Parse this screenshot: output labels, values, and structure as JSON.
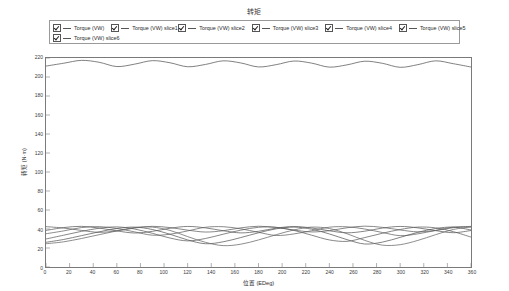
{
  "chart_data": {
    "type": "line",
    "title": "转矩",
    "xlabel": "位置 (EDeg)",
    "ylabel": "转矩 (N·m)",
    "xlim": [
      0,
      360
    ],
    "ylim": [
      0,
      220
    ],
    "xticks": [
      0,
      20,
      40,
      60,
      80,
      100,
      120,
      140,
      160,
      180,
      200,
      220,
      240,
      260,
      280,
      300,
      320,
      340,
      360
    ],
    "yticks": [
      0,
      20,
      40,
      60,
      80,
      100,
      120,
      140,
      160,
      180,
      200,
      220
    ],
    "grid": false,
    "legend_position": "top",
    "series": [
      {
        "name": "Torque (VW)",
        "color": "#555555",
        "checked": true,
        "x": [
          0,
          15,
          30,
          45,
          60,
          75,
          90,
          105,
          120,
          135,
          150,
          165,
          180,
          195,
          210,
          225,
          240,
          255,
          270,
          285,
          300,
          315,
          330,
          345,
          360
        ],
        "values": [
          211.5,
          214.5,
          217.5,
          215.5,
          211.0,
          213.5,
          217.2,
          215.0,
          210.8,
          213.2,
          217.0,
          214.8,
          210.6,
          213.0,
          216.8,
          214.6,
          210.4,
          212.8,
          216.6,
          214.4,
          210.2,
          213.0,
          217.0,
          214.0,
          210.5
        ]
      },
      {
        "name": "Torque (VW) slice1",
        "color": "#606060",
        "checked": true,
        "x": [
          0,
          15,
          30,
          45,
          60,
          75,
          90,
          105,
          120,
          135,
          150,
          165,
          180,
          195,
          210,
          225,
          240,
          255,
          270,
          285,
          300,
          315,
          330,
          345,
          360
        ],
        "values": [
          42.5,
          41.0,
          38.5,
          36.5,
          38.0,
          41.0,
          42.8,
          41.5,
          38.8,
          36.8,
          38.2,
          41.2,
          42.9,
          41.6,
          38.9,
          36.9,
          38.3,
          41.3,
          43.0,
          41.7,
          39.0,
          37.0,
          38.4,
          41.4,
          42.8
        ]
      },
      {
        "name": "Torque (VW) slice2",
        "color": "#5a5a5a",
        "checked": true,
        "x": [
          0,
          15,
          30,
          45,
          60,
          75,
          90,
          105,
          120,
          135,
          150,
          165,
          180,
          195,
          210,
          225,
          240,
          255,
          270,
          285,
          300,
          315,
          330,
          345,
          360
        ],
        "values": [
          38.5,
          41.5,
          42.8,
          41.0,
          38.0,
          35.8,
          37.5,
          40.8,
          42.7,
          41.2,
          38.2,
          35.9,
          37.6,
          40.9,
          42.6,
          41.1,
          38.1,
          36.0,
          37.7,
          41.0,
          42.7,
          41.2,
          38.3,
          36.1,
          38.4
        ]
      },
      {
        "name": "Torque (VW) slice3",
        "color": "#636363",
        "checked": true,
        "x": [
          0,
          15,
          30,
          45,
          60,
          75,
          90,
          105,
          120,
          135,
          150,
          165,
          180,
          195,
          210,
          225,
          240,
          255,
          270,
          285,
          300,
          315,
          330,
          345,
          360
        ],
        "values": [
          35.0,
          38.0,
          41.5,
          42.5,
          40.5,
          37.0,
          33.5,
          34.5,
          38.0,
          41.8,
          42.4,
          40.2,
          36.5,
          33.2,
          34.8,
          38.2,
          41.9,
          42.3,
          40.0,
          36.3,
          33.0,
          34.9,
          38.5,
          42.0,
          42.2
        ]
      },
      {
        "name": "Torque (VW) slice4",
        "color": "#5d5d5d",
        "checked": true,
        "x": [
          0,
          15,
          30,
          45,
          60,
          75,
          90,
          105,
          120,
          135,
          150,
          165,
          180,
          195,
          210,
          225,
          240,
          255,
          270,
          285,
          300,
          315,
          330,
          345,
          360
        ],
        "values": [
          29.5,
          33.5,
          37.5,
          40.8,
          42.2,
          40.0,
          35.5,
          30.5,
          27.5,
          30.0,
          34.5,
          38.8,
          41.8,
          41.8,
          38.5,
          33.5,
          28.5,
          27.0,
          31.0,
          35.5,
          39.5,
          42.0,
          41.2,
          37.2,
          31.5
        ]
      },
      {
        "name": "Torque (VW) slice5",
        "color": "#585858",
        "checked": true,
        "x": [
          0,
          15,
          30,
          45,
          60,
          75,
          90,
          105,
          120,
          135,
          150,
          165,
          180,
          195,
          210,
          225,
          240,
          255,
          270,
          285,
          300,
          315,
          330,
          345,
          360
        ],
        "values": [
          26.0,
          29.0,
          33.0,
          37.0,
          40.5,
          42.0,
          39.5,
          34.5,
          28.5,
          24.5,
          26.5,
          31.0,
          36.0,
          40.2,
          42.0,
          39.8,
          34.8,
          28.8,
          24.2,
          26.2,
          31.2,
          36.5,
          40.5,
          42.0,
          39.0
        ]
      },
      {
        "name": "Torque (VW) slice6",
        "color": "#656565",
        "checked": true,
        "x": [
          0,
          15,
          30,
          45,
          60,
          75,
          90,
          105,
          120,
          135,
          150,
          165,
          180,
          195,
          210,
          225,
          240,
          255,
          270,
          285,
          300,
          315,
          330,
          345,
          360
        ],
        "values": [
          24.5,
          26.5,
          30.0,
          34.0,
          38.0,
          41.5,
          42.0,
          38.5,
          32.0,
          26.0,
          22.5,
          24.0,
          28.5,
          34.0,
          39.0,
          42.0,
          40.5,
          35.0,
          28.0,
          23.0,
          23.5,
          28.0,
          34.0,
          39.5,
          42.2
        ]
      }
    ]
  },
  "legend": {
    "row1": [
      {
        "label": "Torque (VW)"
      },
      {
        "label": "Torque (VW) slice1"
      },
      {
        "label": "Torque (VW) slice2"
      },
      {
        "label": "Torque (VW) slice3"
      },
      {
        "label": "Torque (VW) slice4"
      },
      {
        "label": "Torque (VW) slice5"
      }
    ],
    "row2": [
      {
        "label": "Torque (VW) slice6"
      }
    ]
  }
}
